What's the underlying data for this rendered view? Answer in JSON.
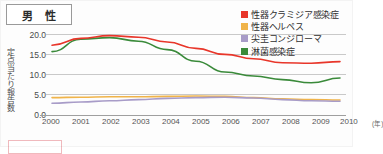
{
  "title": {
    "label": "男 性"
  },
  "axes": {
    "y_caption": "定点当たり報告数",
    "y_ticks": [
      "20.0",
      "15.0",
      "10.0",
      "5.0",
      "0.0"
    ],
    "x_ticks": [
      "2000",
      "2001",
      "2002",
      "2003",
      "2004",
      "2005",
      "2006",
      "2007",
      "2008",
      "2009",
      "2010"
    ],
    "x_unit": "(年)"
  },
  "legend": {
    "items": [
      {
        "label": "性器クラミジア感染症",
        "color": "#e8362a"
      },
      {
        "label": "性器ヘルペス",
        "color": "#f0b44a"
      },
      {
        "label": "尖圭コンジローマ",
        "color": "#a89cc8"
      },
      {
        "label": "淋菌感染症",
        "color": "#3a8a3a"
      }
    ]
  },
  "chart_data": {
    "type": "line",
    "title": "男 性",
    "xlabel": "(年)",
    "ylabel": "定点当たり報告数",
    "x": [
      2000,
      2001,
      2002,
      2003,
      2004,
      2005,
      2006,
      2007,
      2008,
      2009,
      2010
    ],
    "ylim": [
      0.0,
      21.5
    ],
    "yticks": [
      0.0,
      5.0,
      10.0,
      15.0,
      20.0
    ],
    "grid": true,
    "legend_position": "top-right",
    "series": [
      {
        "name": "性器クラミジア感染症",
        "color": "#e8362a",
        "values": [
          17.2,
          18.9,
          19.6,
          19.2,
          18.0,
          16.4,
          14.9,
          13.8,
          12.8,
          12.7,
          13.1
        ]
      },
      {
        "name": "性器ヘルペス",
        "color": "#f0b44a",
        "values": [
          4.1,
          4.2,
          4.3,
          4.3,
          4.4,
          4.5,
          4.4,
          4.1,
          3.8,
          3.6,
          3.5
        ]
      },
      {
        "name": "尖圭コンジローマ",
        "color": "#a89cc8",
        "values": [
          2.7,
          3.0,
          3.3,
          3.6,
          3.9,
          4.1,
          4.2,
          4.0,
          3.6,
          3.3,
          3.2
        ]
      },
      {
        "name": "淋菌感染症",
        "color": "#3a8a3a",
        "values": [
          15.6,
          18.7,
          19.1,
          18.2,
          16.1,
          13.2,
          10.5,
          9.5,
          8.6,
          7.8,
          9.0
        ]
      }
    ]
  }
}
